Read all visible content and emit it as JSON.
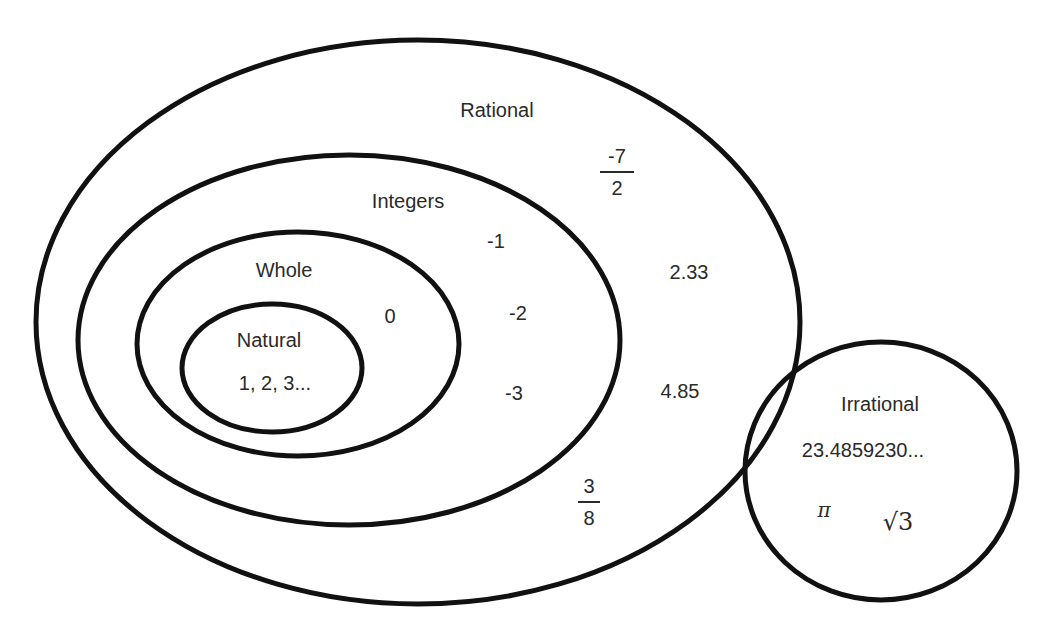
{
  "sets": {
    "rational": {
      "label": "Rational",
      "members": [
        "2.33",
        "4.85"
      ],
      "fractions": [
        {
          "num": "-7",
          "den": "2"
        },
        {
          "num": "3",
          "den": "8"
        }
      ]
    },
    "integers": {
      "label": "Integers",
      "members": [
        "-1",
        "-2",
        "-3"
      ]
    },
    "whole": {
      "label": "Whole",
      "members": [
        "0"
      ]
    },
    "natural": {
      "label": "Natural",
      "members": [
        "1, 2, 3..."
      ]
    },
    "irrational": {
      "label": "Irrational",
      "members": [
        "23.4859230...",
        "π",
        "√3"
      ]
    }
  },
  "colors": {
    "stroke": "#111111",
    "text": "#2a2a2a",
    "background": "#ffffff"
  }
}
